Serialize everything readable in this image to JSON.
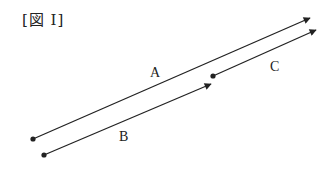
{
  "figure": {
    "title": "[図 I]"
  },
  "vectors": [
    {
      "label": "A",
      "start": [
        33,
        139
      ],
      "end": [
        310,
        18
      ],
      "label_pos": [
        154,
        77
      ]
    },
    {
      "label": "B",
      "start": [
        44,
        155
      ],
      "end": [
        211,
        84
      ],
      "label_pos": [
        124,
        140
      ]
    },
    {
      "label": "C",
      "start": [
        213,
        76
      ],
      "end": [
        316,
        30
      ],
      "label_pos": [
        275,
        71
      ]
    }
  ],
  "colors": {
    "stroke": "#222222"
  }
}
